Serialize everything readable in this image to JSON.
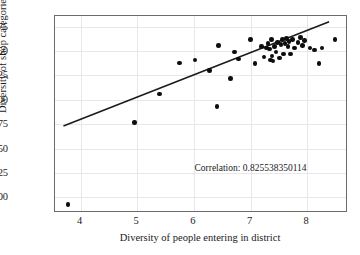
{
  "chart_data": {
    "type": "scatter",
    "title": "",
    "xlabel": "Diversity of people entering in district",
    "ylabel": "Diversity of shop categories",
    "xlim": [
      3.55,
      8.72
    ],
    "ylim": [
      1.84,
      3.86
    ],
    "xticks": [
      "4",
      "5",
      "6",
      "7",
      "8"
    ],
    "xtick_values": [
      4,
      5,
      6,
      7,
      8
    ],
    "yticks": [
      "3.75",
      "3.50",
      "3.25",
      "3.00",
      "2.75",
      "2.50",
      "2.25",
      "2.00"
    ],
    "ytick_values": [
      3.75,
      3.5,
      3.25,
      3.0,
      2.75,
      2.5,
      2.25,
      2.0
    ],
    "grid": true,
    "legend": null,
    "marker_color": "#0d0d0d",
    "line_color": "#1a1a1a",
    "annotations": [
      {
        "text": "Correlation: 0.825538350114",
        "x": 7.0,
        "y": 2.3
      }
    ],
    "trendline": {
      "x": [
        3.7,
        8.42
      ],
      "y": [
        2.72,
        3.8
      ]
    },
    "points": [
      {
        "x": 3.78,
        "y": 1.93
      },
      {
        "x": 4.95,
        "y": 2.77
      },
      {
        "x": 5.39,
        "y": 3.06
      },
      {
        "x": 5.75,
        "y": 3.38
      },
      {
        "x": 6.02,
        "y": 3.41
      },
      {
        "x": 6.28,
        "y": 3.3
      },
      {
        "x": 6.41,
        "y": 2.93
      },
      {
        "x": 6.44,
        "y": 3.56
      },
      {
        "x": 6.65,
        "y": 3.22
      },
      {
        "x": 6.72,
        "y": 3.49
      },
      {
        "x": 6.79,
        "y": 3.42
      },
      {
        "x": 7.0,
        "y": 3.62
      },
      {
        "x": 7.08,
        "y": 3.37
      },
      {
        "x": 7.19,
        "y": 3.55
      },
      {
        "x": 7.24,
        "y": 3.44
      },
      {
        "x": 7.28,
        "y": 3.53
      },
      {
        "x": 7.31,
        "y": 3.58
      },
      {
        "x": 7.33,
        "y": 3.52
      },
      {
        "x": 7.35,
        "y": 3.41
      },
      {
        "x": 7.37,
        "y": 3.62
      },
      {
        "x": 7.38,
        "y": 3.45
      },
      {
        "x": 7.4,
        "y": 3.4
      },
      {
        "x": 7.42,
        "y": 3.55
      },
      {
        "x": 7.45,
        "y": 3.49
      },
      {
        "x": 7.48,
        "y": 3.59
      },
      {
        "x": 7.51,
        "y": 3.43
      },
      {
        "x": 7.54,
        "y": 3.57
      },
      {
        "x": 7.56,
        "y": 3.62
      },
      {
        "x": 7.58,
        "y": 3.47
      },
      {
        "x": 7.61,
        "y": 3.58
      },
      {
        "x": 7.63,
        "y": 3.63
      },
      {
        "x": 7.66,
        "y": 3.55
      },
      {
        "x": 7.68,
        "y": 3.6
      },
      {
        "x": 7.71,
        "y": 3.47
      },
      {
        "x": 7.74,
        "y": 3.62
      },
      {
        "x": 7.78,
        "y": 3.53
      },
      {
        "x": 7.84,
        "y": 3.59
      },
      {
        "x": 7.88,
        "y": 3.64
      },
      {
        "x": 7.92,
        "y": 3.56
      },
      {
        "x": 7.95,
        "y": 3.61
      },
      {
        "x": 8.05,
        "y": 3.53
      },
      {
        "x": 8.13,
        "y": 3.51
      },
      {
        "x": 8.21,
        "y": 3.37
      },
      {
        "x": 8.26,
        "y": 3.53
      },
      {
        "x": 8.49,
        "y": 3.62
      }
    ]
  }
}
